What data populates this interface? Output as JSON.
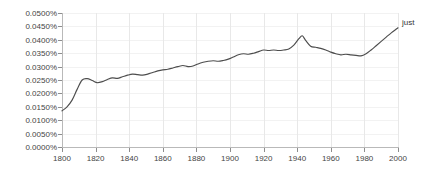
{
  "chart_data": {
    "type": "line",
    "title": "",
    "subtitle": "",
    "xlabel": "",
    "ylabel": "",
    "xlim": [
      1800,
      2000
    ],
    "ylim": [
      0.0,
      0.05
    ],
    "grid": true,
    "legend_position": "right-of-plot",
    "y_tick_labels": [
      "0.0500%",
      "0.0450%",
      "0.0400%",
      "0.0350%",
      "0.0300%",
      "0.0250%",
      "0.0200%",
      "0.0150%",
      "0.0100%",
      "0.0050%",
      "0.0000%"
    ],
    "y_tick_values": [
      0.05,
      0.045,
      0.04,
      0.035,
      0.03,
      0.025,
      0.02,
      0.015,
      0.01,
      0.005,
      0.0
    ],
    "x_tick_labels": [
      "1800",
      "1820",
      "1840",
      "1860",
      "1880",
      "1900",
      "1920",
      "1940",
      "1960",
      "1980",
      "2000"
    ],
    "x_tick_values": [
      1800,
      1820,
      1840,
      1860,
      1880,
      1900,
      1920,
      1940,
      1960,
      1980,
      2000
    ],
    "series": [
      {
        "name": "just",
        "color": "#4d4d4d",
        "x": [
          1800,
          1803,
          1806,
          1809,
          1812,
          1815,
          1818,
          1821,
          1824,
          1827,
          1830,
          1833,
          1836,
          1839,
          1842,
          1845,
          1848,
          1851,
          1854,
          1857,
          1860,
          1863,
          1866,
          1869,
          1872,
          1875,
          1878,
          1881,
          1884,
          1887,
          1890,
          1893,
          1896,
          1899,
          1902,
          1905,
          1908,
          1911,
          1914,
          1917,
          1920,
          1923,
          1926,
          1929,
          1932,
          1935,
          1938,
          1941,
          1943,
          1945,
          1948,
          1951,
          1954,
          1957,
          1960,
          1963,
          1966,
          1969,
          1972,
          1975,
          1978,
          1981,
          1984,
          1987,
          1990,
          1993,
          1996,
          1999,
          2000
        ],
        "values": [
          0.0135,
          0.015,
          0.0175,
          0.0215,
          0.025,
          0.0255,
          0.0248,
          0.024,
          0.0244,
          0.0252,
          0.0258,
          0.0256,
          0.0262,
          0.0268,
          0.0272,
          0.027,
          0.0268,
          0.0272,
          0.0278,
          0.0284,
          0.0288,
          0.029,
          0.0295,
          0.03,
          0.0304,
          0.03,
          0.0302,
          0.031,
          0.0316,
          0.032,
          0.0322,
          0.032,
          0.0323,
          0.0328,
          0.0336,
          0.0344,
          0.0348,
          0.0346,
          0.035,
          0.0356,
          0.0362,
          0.036,
          0.0362,
          0.036,
          0.0362,
          0.0366,
          0.038,
          0.0404,
          0.0415,
          0.0398,
          0.0376,
          0.0372,
          0.0368,
          0.0362,
          0.0354,
          0.0348,
          0.0344,
          0.0346,
          0.0344,
          0.0342,
          0.034,
          0.0348,
          0.0362,
          0.0378,
          0.0394,
          0.041,
          0.0426,
          0.044,
          0.0445
        ]
      }
    ]
  },
  "legend": {
    "just_label": "just"
  }
}
